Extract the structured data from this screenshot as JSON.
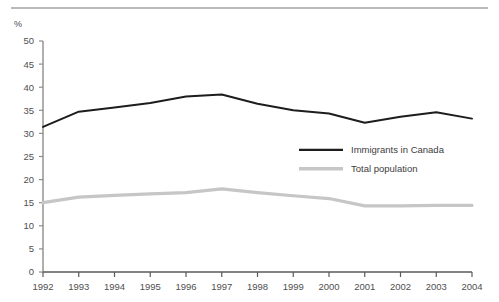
{
  "chart_data": {
    "type": "line",
    "title": "",
    "subtitle": "",
    "xlabel": "",
    "ylabel": "%",
    "unit_label": "%",
    "categories": [
      "1992",
      "1993",
      "1994",
      "1995",
      "1996",
      "1997",
      "1998",
      "1999",
      "2000",
      "2001",
      "2002",
      "2003",
      "2004"
    ],
    "x": [
      1992,
      1993,
      1994,
      1995,
      1996,
      1997,
      1998,
      1999,
      2000,
      2001,
      2002,
      2003,
      2004
    ],
    "ylim": [
      0,
      50
    ],
    "xlim": [
      1992,
      2004
    ],
    "yticks": [
      0,
      5,
      10,
      15,
      20,
      25,
      30,
      35,
      40,
      45,
      50
    ],
    "ytick_labels": [
      "0",
      "5",
      "10",
      "15",
      "20",
      "25",
      "30",
      "35",
      "40",
      "45",
      "50"
    ],
    "xtick_labels": [
      "1992",
      "1993",
      "1994",
      "1995",
      "1996",
      "1997",
      "1998",
      "1999",
      "2000",
      "2001",
      "2002",
      "2003",
      "2004"
    ],
    "grid": false,
    "legend_position": "center-right",
    "series": [
      {
        "name": "Immigrants in Canada",
        "color": "#1d1d1d",
        "values": [
          31.4,
          34.7,
          35.6,
          36.6,
          38.0,
          38.4,
          36.4,
          35.0,
          34.3,
          32.3,
          33.6,
          34.6,
          33.2
        ]
      },
      {
        "name": "Total population",
        "color": "#c6c6c6",
        "values": [
          15.0,
          16.2,
          16.6,
          16.9,
          17.2,
          18.0,
          17.2,
          16.5,
          15.9,
          14.3,
          14.3,
          14.4,
          14.4
        ]
      }
    ],
    "legend": [
      {
        "label": "Immigrants in Canada",
        "color": "#1d1d1d"
      },
      {
        "label": "Total population",
        "color": "#c6c6c6"
      }
    ],
    "colors": {
      "immigrants": "#1d1d1d",
      "total_population": "#c6c6c6",
      "axis": "#8d8d8d",
      "rule": "#b9b9b9",
      "text": "#4f4f4f"
    }
  }
}
